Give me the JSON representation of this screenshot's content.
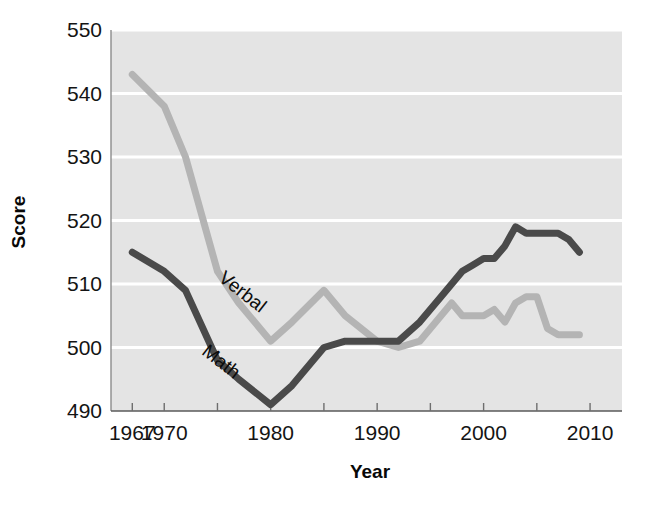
{
  "chart_data": {
    "type": "line",
    "title": "",
    "xlabel": "Year",
    "ylabel": "Score",
    "xlim": [
      1965,
      2013
    ],
    "ylim": [
      490,
      550
    ],
    "yticks": [
      490,
      500,
      510,
      520,
      530,
      540,
      550
    ],
    "xticks": [
      1967,
      1970,
      1980,
      1990,
      2000,
      2010
    ],
    "xtick_labels": [
      "1967",
      "1970",
      "1980",
      "1990",
      "2000",
      "2010"
    ],
    "ytick_labels": [
      "490",
      "500",
      "510",
      "520",
      "530",
      "540",
      "550"
    ],
    "minor_xticks": [
      1970,
      1975,
      1980,
      1985,
      1990,
      1995,
      2000,
      2005,
      2010
    ],
    "grid": "horizontal-white-on-gray",
    "legend": "inline-labels",
    "plot_background": "#e4e4e4",
    "gridline_color": "#ffffff",
    "series": [
      {
        "name": "Verbal",
        "color": "#b4b4b4",
        "label_x": 1977,
        "label_y": 508,
        "label_rotation": 38,
        "x": [
          1967,
          1970,
          1972,
          1975,
          1977,
          1980,
          1982,
          1985,
          1987,
          1990,
          1992,
          1994,
          1996,
          1997,
          1998,
          1999,
          2000,
          2001,
          2002,
          2003,
          2004,
          2005,
          2006,
          2007,
          2008,
          2009
        ],
        "y": [
          543,
          538,
          530,
          512,
          507,
          501,
          504,
          509,
          505,
          501,
          500,
          501,
          505,
          507,
          505,
          505,
          505,
          506,
          504,
          507,
          508,
          508,
          503,
          502,
          502,
          502
        ]
      },
      {
        "name": "Math",
        "color": "#4a4a4a",
        "label_x": 1975,
        "label_y": 497,
        "label_rotation": 38,
        "x": [
          1967,
          1970,
          1972,
          1975,
          1977,
          1980,
          1982,
          1985,
          1987,
          1990,
          1992,
          1994,
          1996,
          1998,
          1999,
          2000,
          2001,
          2002,
          2003,
          2004,
          2005,
          2006,
          2007,
          2008,
          2009
        ],
        "y": [
          515,
          512,
          509,
          498,
          495,
          491,
          494,
          500,
          501,
          501,
          501,
          504,
          508,
          512,
          513,
          514,
          514,
          516,
          519,
          518,
          518,
          518,
          518,
          517,
          515
        ]
      }
    ]
  },
  "axes": {
    "y_title": "Score",
    "x_title": "Year"
  },
  "series_labels": {
    "verbal": "Verbal",
    "math": "Math"
  }
}
